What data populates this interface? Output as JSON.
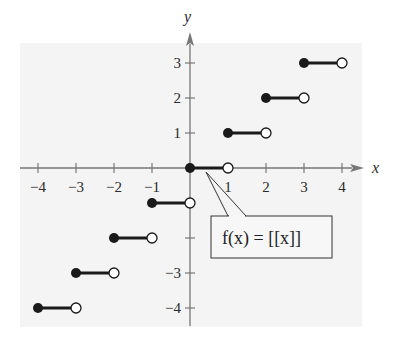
{
  "chart_data": {
    "type": "line",
    "title": "",
    "subtitle": "",
    "function_label": "f(x) = [[x]]",
    "xlabel": "x",
    "ylabel": "y",
    "xlim": [
      -4.5,
      4.5
    ],
    "ylim": [
      -4.5,
      4.5
    ],
    "x_ticks": [
      -4,
      -3,
      -2,
      -1,
      1,
      2,
      3,
      4
    ],
    "y_ticks": [
      -4,
      -3,
      -2,
      -1,
      1,
      2,
      3
    ],
    "x_tick_labels": [
      "−4",
      "−3",
      "−2",
      "−1",
      "1",
      "2",
      "3",
      "4"
    ],
    "y_tick_labels": [
      "−4",
      "−3",
      "1",
      "2",
      "3"
    ],
    "grid": false,
    "legend": null,
    "series": [
      {
        "name": "f(x) = [[x]]",
        "kind": "step",
        "segments": [
          {
            "x_start": -4,
            "x_end": -3,
            "y": -4,
            "start": "closed",
            "end": "open"
          },
          {
            "x_start": -3,
            "x_end": -2,
            "y": -3,
            "start": "closed",
            "end": "open"
          },
          {
            "x_start": -2,
            "x_end": -1,
            "y": -2,
            "start": "closed",
            "end": "open"
          },
          {
            "x_start": -1,
            "x_end": 0,
            "y": -1,
            "start": "closed",
            "end": "open"
          },
          {
            "x_start": 0,
            "x_end": 1,
            "y": 0,
            "start": "closed",
            "end": "open"
          },
          {
            "x_start": 1,
            "x_end": 2,
            "y": 1,
            "start": "closed",
            "end": "open"
          },
          {
            "x_start": 2,
            "x_end": 3,
            "y": 2,
            "start": "closed",
            "end": "open"
          },
          {
            "x_start": 3,
            "x_end": 4,
            "y": 3,
            "start": "closed",
            "end": "open"
          }
        ]
      }
    ],
    "annotations": [
      {
        "text": "f(x) = [[x]]",
        "type": "callout-box",
        "points_to": [
          0.5,
          0
        ]
      }
    ]
  },
  "colors": {
    "background": "#f4f4f4",
    "axis": "#777777",
    "segment": "#1a1a1a"
  }
}
